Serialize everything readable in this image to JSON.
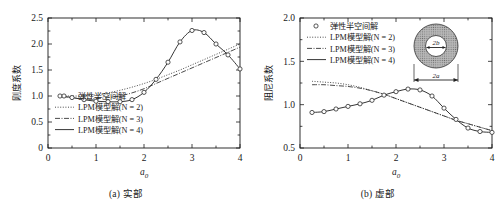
{
  "figure": {
    "panels": [
      {
        "id": "panel-a",
        "caption": "(a) 实部",
        "ylabel": "刚度系数",
        "xlabel": "a",
        "xlabel_sub": "0",
        "ylim": [
          0,
          2.5
        ],
        "xlim": [
          0,
          4
        ],
        "yticks": [
          "0",
          "0.5",
          "1.0",
          "1.5",
          "2.0",
          "2.5"
        ],
        "ytick_values": [
          0,
          0.5,
          1.0,
          1.5,
          2.0,
          2.5
        ],
        "xticks": [
          "0",
          "1",
          "2",
          "3",
          "4"
        ],
        "xtick_values": [
          0,
          1,
          2,
          3,
          4
        ],
        "has_inset": false
      },
      {
        "id": "panel-b",
        "caption": "(b) 虚部",
        "ylabel": "阻尼系数",
        "xlabel": "a",
        "xlabel_sub": "0",
        "ylim": [
          0.5,
          2.0
        ],
        "xlim": [
          0,
          4
        ],
        "yticks": [
          "0.5",
          "1.0",
          "1.5",
          "2.0"
        ],
        "ytick_values": [
          0.5,
          1.0,
          1.5,
          2.0
        ],
        "xticks": [
          "0",
          "1",
          "2",
          "3",
          "4"
        ],
        "xtick_values": [
          0,
          1,
          2,
          3,
          4
        ],
        "has_inset": true
      }
    ],
    "legend": [
      {
        "label": "弹性半空间解",
        "style": "marker",
        "marker": "circle-open"
      },
      {
        "label": "LPM模型解(N = 2)",
        "style": "dotted"
      },
      {
        "label": "LPM模型解(N = 3)",
        "style": "dashdot"
      },
      {
        "label": "LPM模型解(N = 4)",
        "style": "solid"
      }
    ],
    "inset": {
      "name": "annulus-diagram",
      "inner_label": "2b",
      "outer_label": "2a"
    },
    "colors": {
      "axis": "#1a1a1a",
      "curve": "#2b2b2b",
      "marker_fill": "#ffffff",
      "inset_fill": "#9a9a9a"
    }
  },
  "chart_data": [
    {
      "type": "line",
      "title": "(a) 实部",
      "xlabel": "a0",
      "ylabel": "刚度系数",
      "xlim": [
        0,
        4
      ],
      "ylim": [
        0,
        2.5
      ],
      "grid": false,
      "legend_position": "lower-left",
      "series": [
        {
          "name": "弹性半空间解",
          "type": "scatter",
          "marker": "circle-open",
          "x": [
            0.25,
            0.5,
            0.75,
            1.0,
            1.25,
            1.5,
            1.75,
            2.0,
            2.25,
            2.5,
            2.75,
            3.0,
            3.25,
            3.5,
            3.75,
            4.0
          ],
          "y": [
            1.0,
            0.97,
            0.93,
            0.9,
            0.89,
            0.89,
            0.93,
            1.07,
            1.32,
            1.65,
            2.04,
            2.26,
            2.22,
            2.0,
            1.79,
            1.52
          ]
        },
        {
          "name": "LPM模型解(N = 2)",
          "type": "line",
          "style": "dotted",
          "x": [
            0.25,
            0.5,
            0.75,
            1.0,
            1.25,
            1.5,
            1.75,
            2.0,
            2.25,
            2.5,
            2.75,
            3.0,
            3.25,
            3.5,
            3.75,
            4.0
          ],
          "y": [
            1.0,
            1.0,
            1.0,
            1.02,
            1.06,
            1.11,
            1.17,
            1.24,
            1.32,
            1.41,
            1.5,
            1.6,
            1.7,
            1.8,
            1.9,
            2.0
          ]
        },
        {
          "name": "LPM模型解(N = 3)",
          "type": "line",
          "style": "dashdot",
          "x": [
            0.25,
            0.5,
            0.75,
            1.0,
            1.25,
            1.5,
            1.75,
            2.0,
            2.25,
            2.5,
            2.75,
            3.0,
            3.25,
            3.5,
            3.75,
            4.0
          ],
          "y": [
            0.99,
            0.97,
            0.95,
            0.95,
            0.97,
            1.0,
            1.06,
            1.14,
            1.24,
            1.34,
            1.44,
            1.54,
            1.64,
            1.74,
            1.84,
            1.94
          ]
        },
        {
          "name": "LPM模型解(N = 4)",
          "type": "line",
          "style": "solid",
          "x": [
            0.25,
            0.5,
            0.75,
            1.0,
            1.25,
            1.5,
            1.75,
            2.0,
            2.25,
            2.5,
            2.75,
            3.0,
            3.25,
            3.5,
            3.75,
            4.0
          ],
          "y": [
            1.0,
            0.97,
            0.93,
            0.9,
            0.89,
            0.89,
            0.93,
            1.07,
            1.32,
            1.65,
            2.04,
            2.26,
            2.22,
            2.0,
            1.79,
            1.52
          ]
        }
      ]
    },
    {
      "type": "line",
      "title": "(b) 虚部",
      "xlabel": "a0",
      "ylabel": "阻尼系数",
      "xlim": [
        0,
        4
      ],
      "ylim": [
        0.5,
        2.0
      ],
      "grid": false,
      "legend_position": "upper-left",
      "series": [
        {
          "name": "弹性半空间解",
          "type": "scatter",
          "marker": "circle-open",
          "x": [
            0.25,
            0.5,
            0.75,
            1.0,
            1.25,
            1.5,
            1.75,
            2.0,
            2.25,
            2.5,
            2.75,
            3.0,
            3.25,
            3.5,
            3.75,
            4.0
          ],
          "y": [
            0.91,
            0.92,
            0.95,
            0.98,
            1.01,
            1.05,
            1.11,
            1.15,
            1.18,
            1.17,
            1.1,
            0.96,
            0.83,
            0.73,
            0.69,
            0.68
          ]
        },
        {
          "name": "LPM模型解(N = 2)",
          "type": "line",
          "style": "dotted",
          "x": [
            0.25,
            0.5,
            0.75,
            1.0,
            1.25,
            1.5,
            1.75,
            2.0,
            2.25,
            2.5,
            2.75,
            3.0,
            3.25,
            3.5,
            3.75,
            4.0
          ],
          "y": [
            1.27,
            1.26,
            1.25,
            1.23,
            1.2,
            1.16,
            1.12,
            1.07,
            1.02,
            0.97,
            0.92,
            0.87,
            0.82,
            0.78,
            0.74,
            0.7
          ]
        },
        {
          "name": "LPM模型解(N = 3)",
          "type": "line",
          "style": "dashdot",
          "x": [
            0.25,
            0.5,
            0.75,
            1.0,
            1.25,
            1.5,
            1.75,
            2.0,
            2.25,
            2.5,
            2.75,
            3.0,
            3.25,
            3.5,
            3.75,
            4.0
          ],
          "y": [
            1.23,
            1.23,
            1.22,
            1.21,
            1.19,
            1.16,
            1.12,
            1.07,
            1.02,
            0.97,
            0.92,
            0.87,
            0.82,
            0.78,
            0.74,
            0.7
          ]
        },
        {
          "name": "LPM模型解(N = 4)",
          "type": "line",
          "style": "solid",
          "x": [
            0.25,
            0.5,
            0.75,
            1.0,
            1.25,
            1.5,
            1.75,
            2.0,
            2.25,
            2.5,
            2.75,
            3.0,
            3.25,
            3.5,
            3.75,
            4.0
          ],
          "y": [
            0.91,
            0.92,
            0.95,
            0.98,
            1.01,
            1.05,
            1.11,
            1.15,
            1.18,
            1.17,
            1.1,
            0.96,
            0.83,
            0.73,
            0.69,
            0.68
          ]
        }
      ]
    }
  ]
}
